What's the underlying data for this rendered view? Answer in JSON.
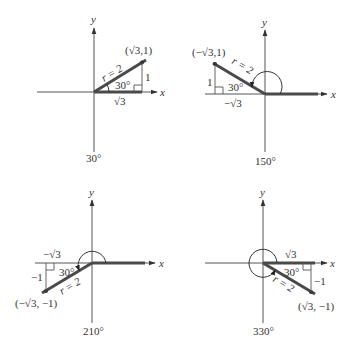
{
  "figure": {
    "axis_labels": {
      "x": "x",
      "y": "y"
    },
    "panels": [
      {
        "angle_label": "30°",
        "point_label": "(√3,1)",
        "radius_label": "r = 2",
        "ref_angle_label": "30°",
        "horizontal_leg_label": "√3",
        "vertical_leg_label": "1",
        "quadrant": "I"
      },
      {
        "angle_label": "150°",
        "point_label": "(−√3,1)",
        "radius_label": "r = 2",
        "ref_angle_label": "30°",
        "horizontal_leg_label": "−√3",
        "vertical_leg_label": "1",
        "quadrant": "II"
      },
      {
        "angle_label": "210°",
        "point_label": "(−√3, −1)",
        "radius_label": "r = 2",
        "ref_angle_label": "30°",
        "horizontal_leg_label": "−√3",
        "vertical_leg_label": "−1",
        "quadrant": "III"
      },
      {
        "angle_label": "330°",
        "point_label": "(√3, −1)",
        "radius_label": "r = 2",
        "ref_angle_label": "30°",
        "horizontal_leg_label": "√3",
        "vertical_leg_label": "−1",
        "quadrant": "IV"
      }
    ]
  }
}
